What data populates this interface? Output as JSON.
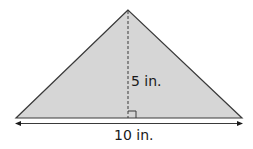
{
  "figure": {
    "shape": "triangle",
    "fill_color": "#d6d6d6",
    "stroke_color": "#3a3a3a",
    "height_label": "5 in.",
    "base_label": "10 in.",
    "height_line_style": "dashed",
    "right_angle_marker": true,
    "base_dimension_arrows": true
  }
}
